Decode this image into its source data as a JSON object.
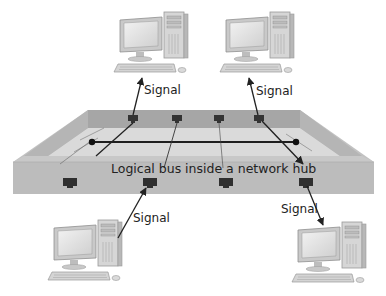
{
  "diagram": {
    "title": "Logical bus inside a network hub",
    "hub_label": "Logical bus inside a network hub",
    "signal_labels": {
      "top_left": "Signal",
      "top_right": "Signal",
      "bottom_left": "Signal",
      "bottom_right": "Signal"
    },
    "nodes": [
      {
        "id": "pc-top-left",
        "type": "desktop-computer",
        "position": "top-left"
      },
      {
        "id": "pc-top-right",
        "type": "desktop-computer",
        "position": "top-right"
      },
      {
        "id": "pc-bottom-left",
        "type": "desktop-computer",
        "position": "bottom-left"
      },
      {
        "id": "pc-bottom-right",
        "type": "desktop-computer",
        "position": "bottom-right"
      },
      {
        "id": "hub",
        "type": "network-hub",
        "ports_back": 4,
        "ports_front": 4
      }
    ],
    "edges": [
      {
        "from": "hub",
        "to": "pc-top-left",
        "label": "Signal",
        "direction": "hub-to-pc"
      },
      {
        "from": "hub",
        "to": "pc-top-right",
        "label": "Signal",
        "direction": "hub-to-pc"
      },
      {
        "from": "pc-bottom-left",
        "to": "hub",
        "label": "Signal",
        "direction": "pc-to-hub"
      },
      {
        "from": "hub",
        "to": "pc-bottom-right",
        "label": "Signal",
        "direction": "hub-to-pc"
      }
    ],
    "colors": {
      "hub_front": "#bdbdbd",
      "hub_back_wall": "#a9a9a9",
      "hub_side": "#c4c4c4",
      "hub_floor": "#dcdcdc",
      "port": "#333333",
      "line": "#222222",
      "text": "#222222"
    }
  }
}
